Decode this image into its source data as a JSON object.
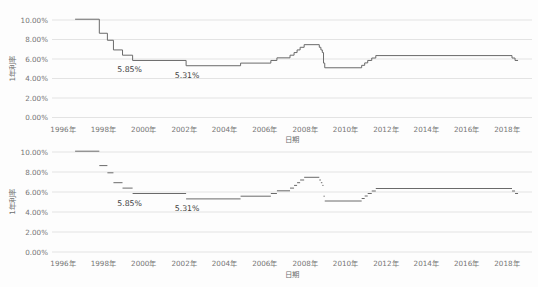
{
  "page": {
    "background": "#fdfdfd"
  },
  "colors": {
    "line": "#6a6a6a",
    "grid": "#e3e3e3",
    "tick_text": "#767676",
    "annotation_text": "#3f3f3f"
  },
  "chart_data": [
    {
      "type": "line",
      "subtype": "step",
      "draw_vertical_connectors": true,
      "title": "",
      "xlabel": "日期",
      "ylabel": "1年利率",
      "ylim": [
        0,
        10
      ],
      "xlim": [
        1995.45,
        2019.2
      ],
      "grid": "horizontal",
      "legend": "none",
      "line_color": "#6a6a6a",
      "y_ticks": [
        0,
        2,
        4,
        6,
        8,
        10
      ],
      "y_tick_labels": [
        "0.00%",
        "2.00%",
        "4.00%",
        "6.00%",
        "8.00%",
        "10.00%"
      ],
      "x_ticks": [
        1996,
        1998,
        2000,
        2002,
        2004,
        2006,
        2008,
        2010,
        2012,
        2014,
        2016,
        2018
      ],
      "x_tick_labels": [
        "1996年",
        "1998年",
        "2000年",
        "2002年",
        "2004年",
        "2006年",
        "2008年",
        "2010年",
        "2012年",
        "2014年",
        "2016年",
        "2018年"
      ],
      "series": [
        {
          "name": "1年利率",
          "end_x": 2018.55,
          "points": [
            [
              1996.6,
              10.08
            ],
            [
              1997.8,
              8.64
            ],
            [
              1998.2,
              7.92
            ],
            [
              1998.5,
              6.93
            ],
            [
              1998.95,
              6.39
            ],
            [
              1999.45,
              5.85
            ],
            [
              2002.1,
              5.31
            ],
            [
              2004.8,
              5.58
            ],
            [
              2006.3,
              5.85
            ],
            [
              2006.6,
              6.12
            ],
            [
              2007.25,
              6.39
            ],
            [
              2007.45,
              6.66
            ],
            [
              2007.6,
              6.93
            ],
            [
              2007.75,
              7.2
            ],
            [
              2007.95,
              7.47
            ],
            [
              2008.7,
              7.2
            ],
            [
              2008.78,
              6.93
            ],
            [
              2008.85,
              6.66
            ],
            [
              2008.91,
              5.58
            ],
            [
              2008.97,
              5.1
            ],
            [
              2010.8,
              5.35
            ],
            [
              2010.95,
              5.6
            ],
            [
              2011.1,
              5.85
            ],
            [
              2011.3,
              6.1
            ],
            [
              2011.5,
              6.35
            ],
            [
              2018.25,
              6.1
            ],
            [
              2018.4,
              5.85
            ]
          ]
        }
      ],
      "annotations": [
        {
          "text": "5.85%",
          "x": 1999.3,
          "y": 5.85
        },
        {
          "text": "5.31%",
          "x": 2002.15,
          "y": 5.31
        }
      ]
    },
    {
      "type": "line",
      "subtype": "step",
      "draw_vertical_connectors": false,
      "title": "",
      "xlabel": "日期",
      "ylabel": "1年利率",
      "ylim": [
        0,
        10
      ],
      "xlim": [
        1995.45,
        2019.2
      ],
      "grid": "horizontal",
      "legend": "none",
      "line_color": "#6a6a6a",
      "y_ticks": [
        0,
        2,
        4,
        6,
        8,
        10
      ],
      "y_tick_labels": [
        "0.00%",
        "2.00%",
        "4.00%",
        "6.00%",
        "8.00%",
        "10.00%"
      ],
      "x_ticks": [
        1996,
        1998,
        2000,
        2002,
        2004,
        2006,
        2008,
        2010,
        2012,
        2014,
        2016,
        2018
      ],
      "x_tick_labels": [
        "1996年",
        "1998年",
        "2000年",
        "2002年",
        "2004年",
        "2006年",
        "2008年",
        "2010年",
        "2012年",
        "2014年",
        "2016年",
        "2018年"
      ],
      "series": [
        {
          "name": "1年利率",
          "end_x": 2018.55,
          "points": [
            [
              1996.6,
              10.08
            ],
            [
              1997.8,
              8.64
            ],
            [
              1998.2,
              7.92
            ],
            [
              1998.5,
              6.93
            ],
            [
              1998.95,
              6.39
            ],
            [
              1999.45,
              5.85
            ],
            [
              2002.1,
              5.31
            ],
            [
              2004.8,
              5.58
            ],
            [
              2006.3,
              5.85
            ],
            [
              2006.6,
              6.12
            ],
            [
              2007.25,
              6.39
            ],
            [
              2007.45,
              6.66
            ],
            [
              2007.6,
              6.93
            ],
            [
              2007.75,
              7.2
            ],
            [
              2007.95,
              7.47
            ],
            [
              2008.7,
              7.2
            ],
            [
              2008.78,
              6.93
            ],
            [
              2008.85,
              6.66
            ],
            [
              2008.91,
              5.58
            ],
            [
              2008.97,
              5.1
            ],
            [
              2010.8,
              5.35
            ],
            [
              2010.95,
              5.6
            ],
            [
              2011.1,
              5.85
            ],
            [
              2011.3,
              6.1
            ],
            [
              2011.5,
              6.35
            ],
            [
              2018.25,
              6.1
            ],
            [
              2018.4,
              5.85
            ]
          ]
        }
      ],
      "annotations": [
        {
          "text": "5.85%",
          "x": 1999.3,
          "y": 5.85
        },
        {
          "text": "5.31%",
          "x": 2002.15,
          "y": 5.31
        }
      ]
    }
  ]
}
